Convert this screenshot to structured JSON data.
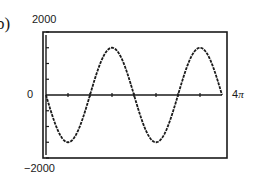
{
  "figure": {
    "part_label": "b)",
    "top_mark": "m"
  },
  "axes": {
    "ymax_label": "2000",
    "ymin_label": "−2000",
    "zero_label": "0",
    "xmax_label_num": "4",
    "xmax_label_sym": "π"
  },
  "chart_data": {
    "type": "line",
    "title": "",
    "xlabel": "",
    "ylabel": "",
    "xlim": [
      0,
      12.566
    ],
    "ylim": [
      -2000,
      2000
    ],
    "x_tick_labels": [
      "4π"
    ],
    "y_tick_labels": [
      "2000",
      "0",
      "-2000"
    ],
    "x_tick_step": "π/2",
    "y_tick_step": 500,
    "grid": false,
    "legend": null,
    "function": "y = -1500 sin(x)",
    "series": [
      {
        "name": "curve",
        "x": [
          0,
          0.785,
          1.571,
          2.356,
          3.142,
          3.927,
          4.712,
          5.498,
          6.283,
          7.069,
          7.854,
          8.639,
          9.425,
          10.21,
          10.996,
          11.781,
          12.566
        ],
        "values": [
          0,
          -1061,
          -1500,
          -1061,
          0,
          1061,
          1500,
          1061,
          0,
          -1061,
          -1500,
          -1061,
          0,
          1061,
          1500,
          1061,
          0
        ]
      }
    ],
    "colors": {
      "line": "#1a1a1a",
      "frame": "#1a1a1a",
      "background": "#ffffff"
    }
  }
}
